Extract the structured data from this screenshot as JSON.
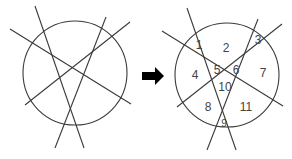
{
  "before_figure": {
    "circle": {
      "cx": 75,
      "cy": 73,
      "r": 52
    },
    "lines": [
      {
        "x1": 35,
        "y1": 6,
        "x2": 84,
        "y2": 148
      },
      {
        "x1": 10,
        "y1": 29,
        "x2": 131,
        "y2": 104
      },
      {
        "x1": 106,
        "y1": 17,
        "x2": 55,
        "y2": 148
      },
      {
        "x1": 130,
        "y1": 22,
        "x2": 25,
        "y2": 105
      }
    ]
  },
  "arrow": {
    "direction": "right",
    "color": "#000000"
  },
  "after_figure": {
    "region_count": 11,
    "labels": [
      {
        "text": "1",
        "x": 199,
        "y": 45
      },
      {
        "text": "2",
        "x": 226,
        "y": 48
      },
      {
        "text": "3",
        "x": 258,
        "y": 40
      },
      {
        "text": "4",
        "x": 195,
        "y": 75
      },
      {
        "text": "5",
        "x": 217,
        "y": 70
      },
      {
        "text": "6",
        "x": 236,
        "y": 70
      },
      {
        "text": "7",
        "x": 263,
        "y": 73
      },
      {
        "text": "8",
        "x": 208,
        "y": 107
      },
      {
        "text": "9",
        "x": 224,
        "y": 123
      },
      {
        "text": "10",
        "x": 225,
        "y": 87
      },
      {
        "text": "11",
        "x": 246,
        "y": 107
      }
    ]
  }
}
